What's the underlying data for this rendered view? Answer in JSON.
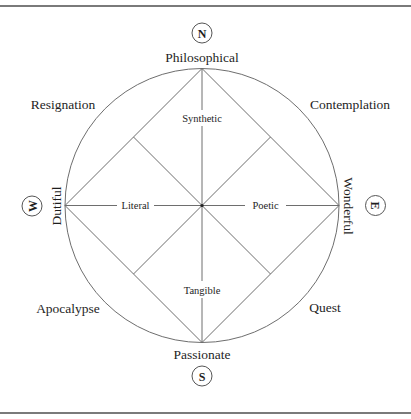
{
  "diagram": {
    "compass": {
      "north": "N",
      "south": "S",
      "east": "E",
      "west": "W"
    },
    "poles": {
      "top": "Philosophical",
      "bottom": "Passionate",
      "left": "Dutiful",
      "right": "Wonderful"
    },
    "quadrants": {
      "top_left": "Resignation",
      "top_right": "Contemplation",
      "bottom_left": "Apocalypse",
      "bottom_right": "Quest"
    },
    "axes": {
      "upper": "Synthetic",
      "lower": "Tangible",
      "left": "Literal",
      "right": "Poetic"
    },
    "colors": {
      "line": "#6e6e6e",
      "text": "#1e1e1e",
      "rule": "#7a7a7a"
    }
  }
}
